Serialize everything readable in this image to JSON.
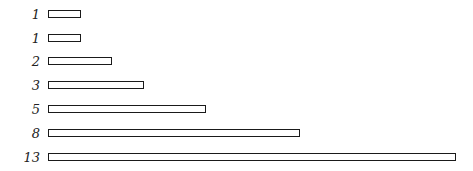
{
  "chart_data": {
    "type": "bar",
    "orientation": "horizontal",
    "title": "",
    "xlabel": "",
    "ylabel": "",
    "categories": [
      "1",
      "1",
      "2",
      "3",
      "5",
      "8",
      "13"
    ],
    "values": [
      1,
      1,
      2,
      3,
      5,
      8,
      13
    ],
    "grid": false,
    "legend": null,
    "style": "hand-drawn outline bars (Fibonacci sequence)"
  },
  "layout": {
    "px_per_unit": 31.2,
    "row_tops": [
      10,
      34,
      57,
      81,
      105,
      129,
      153
    ]
  }
}
